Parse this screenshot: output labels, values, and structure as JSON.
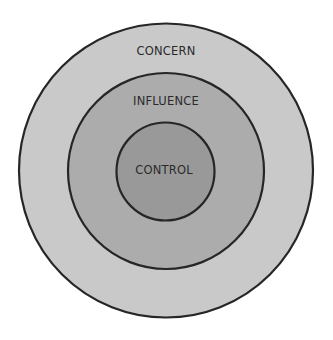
{
  "diagram": {
    "circles": [
      {
        "id": "concern",
        "label": "CONCERN",
        "fill": "#c9c9c9"
      },
      {
        "id": "influence",
        "label": "INFLUENCE",
        "fill": "#acacac"
      },
      {
        "id": "control",
        "label": "CONTROL",
        "fill": "#999999"
      }
    ],
    "stroke_color": "#262626",
    "background": "#ffffff"
  }
}
